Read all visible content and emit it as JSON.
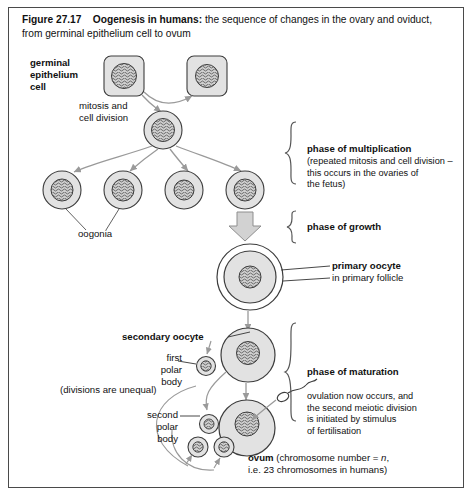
{
  "figure": {
    "number": "Figure 27.17",
    "title": "Oogenesis in humans:",
    "subtitle": "the sequence of changes in the ovary and oviduct, from germinal epithelium cell to ovum"
  },
  "labels": {
    "germinal_epithelium_cell": "germinal\nepithelium\ncell",
    "germinal_l1": "germinal",
    "germinal_l2": "epithelium",
    "germinal_l3": "cell",
    "mitosis_l1": "mitosis and",
    "mitosis_l2": "cell division",
    "oogonia": "oogonia",
    "divisions_unequal": "(divisions are unequal)",
    "first_polar_l1": "first",
    "first_polar_l2": "polar",
    "first_polar_l3": "body",
    "second_polar_l1": "second",
    "second_polar_l2": "polar",
    "second_polar_l3": "body",
    "secondary_oocyte": "secondary oocyte",
    "primary_oocyte": "primary oocyte",
    "primary_oocyte_sub": "in primary follicle"
  },
  "phases": {
    "multiplication": {
      "title": "phase of multiplication",
      "detail_l1": "(repeated mitosis and cell division –",
      "detail_l2": "this occurs in the ovaries of",
      "detail_l3": "the fetus)"
    },
    "growth": {
      "title": "phase of growth"
    },
    "maturation": {
      "title": "phase of maturation",
      "detail_l1": "ovulation now occurs, and",
      "detail_l2": "the second meiotic division",
      "detail_l3": "is initiated by stimulus",
      "detail_l4": "of fertilisation"
    }
  },
  "ovum": {
    "name": "ovum",
    "detail_a": "(chromosome number = ",
    "detail_n": "n",
    "detail_b": ",",
    "detail_l2": "i.e. 23 chromosomes in humans)"
  },
  "colors": {
    "border": "#4a4a4a",
    "cell_fill": "#e2e2e2",
    "cell_stroke": "#3d3d3d",
    "nucleus_fill": "#c9c9c9",
    "arrow_grey": "#9a9a9a",
    "block_arrow_fill": "#d2d2d2",
    "text": "#111111",
    "background": "#ffffff"
  },
  "diagram": {
    "type": "biology-process-flow",
    "stages": [
      {
        "id": "germinal-cell-1",
        "shape": "rounded-square",
        "cx": 124,
        "cy": 76
      },
      {
        "id": "germinal-cell-2",
        "shape": "rounded-square",
        "cx": 207,
        "cy": 76
      },
      {
        "id": "oogonium-parent",
        "shape": "circle",
        "cx": 163,
        "cy": 130
      },
      {
        "id": "oogonium-1",
        "shape": "circle",
        "cx": 62,
        "cy": 190
      },
      {
        "id": "oogonium-2",
        "shape": "circle",
        "cx": 123,
        "cy": 190
      },
      {
        "id": "oogonium-3",
        "shape": "circle",
        "cx": 184,
        "cy": 190
      },
      {
        "id": "oogonium-4",
        "shape": "circle",
        "cx": 245,
        "cy": 190
      },
      {
        "id": "primary-oocyte",
        "shape": "follicle",
        "cx": 250,
        "cy": 277
      },
      {
        "id": "secondary-oocyte",
        "shape": "circle",
        "cx": 248,
        "cy": 355
      },
      {
        "id": "first-polar-body",
        "shape": "polar-body",
        "cx": 206,
        "cy": 366
      },
      {
        "id": "ovum",
        "shape": "circle",
        "cx": 247,
        "cy": 428
      },
      {
        "id": "polar-body-a",
        "shape": "polar-body",
        "cx": 209,
        "cy": 424
      },
      {
        "id": "polar-body-b",
        "shape": "polar-body",
        "cx": 199,
        "cy": 447
      },
      {
        "id": "polar-body-c",
        "shape": "polar-body",
        "cx": 224,
        "cy": 447
      },
      {
        "id": "sperm",
        "shape": "sperm",
        "cx": 295,
        "cy": 395
      }
    ]
  }
}
